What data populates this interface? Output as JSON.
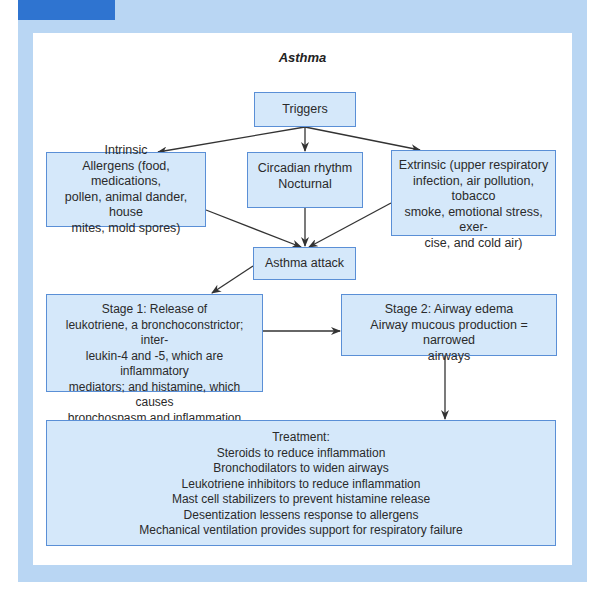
{
  "diagram": {
    "title": "Asthma",
    "colors": {
      "panel": "#b9d6f3",
      "tab": "#2f74d0",
      "box_fill": "#d5e8fa",
      "box_border": "#5a8fd6",
      "arrow": "#333333"
    },
    "nodes": {
      "triggers": {
        "lines": [
          "Triggers"
        ]
      },
      "intrinsic": {
        "lines": [
          "Intrinsic",
          "Allergens (food, medications,",
          "pollen, animal dander, house",
          "mites, mold spores)"
        ]
      },
      "circadian": {
        "lines": [
          "Circadian rhythm",
          "Nocturnal"
        ]
      },
      "extrinsic": {
        "lines": [
          "Extrinsic (upper respiratory",
          "infection, air pollution, tobacco",
          "smoke, emotional stress, exer-",
          "cise, and cold air)"
        ]
      },
      "attack": {
        "lines": [
          "Asthma attack"
        ]
      },
      "stage1": {
        "lines": [
          "Stage 1: Release of",
          "leukotriene, a bronchoconstrictor; inter-",
          "leukin-4 and -5, which are inflammatory",
          "mediators; and histamine, which causes",
          "bronchospasm and inflammation"
        ]
      },
      "stage2": {
        "lines": [
          "Stage 2: Airway edema",
          "Airway mucous production = narrowed",
          "airways"
        ]
      },
      "treatment": {
        "lines": [
          "Treatment:",
          "Steroids to reduce inflammation",
          "Bronchodilators to widen airways",
          "Leukotriene inhibitors to reduce inflammation",
          "Mast cell stabilizers to prevent histamine release",
          "Desentization lessens response to allergens",
          "Mechanical ventilation provides support for respiratory failure"
        ]
      }
    },
    "edges": [
      {
        "from": "triggers",
        "to": "intrinsic"
      },
      {
        "from": "triggers",
        "to": "circadian"
      },
      {
        "from": "triggers",
        "to": "extrinsic"
      },
      {
        "from": "intrinsic",
        "to": "attack"
      },
      {
        "from": "circadian",
        "to": "attack"
      },
      {
        "from": "extrinsic",
        "to": "attack"
      },
      {
        "from": "attack",
        "to": "stage1"
      },
      {
        "from": "stage1",
        "to": "stage2"
      },
      {
        "from": "stage2",
        "to": "treatment"
      }
    ]
  }
}
